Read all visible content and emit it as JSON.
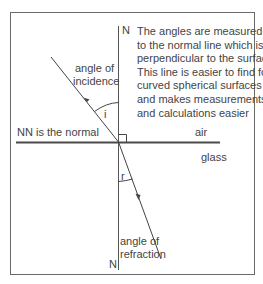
{
  "diagram": {
    "normal_top_label": "N",
    "normal_bottom_label": "N",
    "incidence_label_line1": "angle of",
    "incidence_label_line2": "incidence",
    "incidence_symbol": "i",
    "refraction_label_line1": "angle of",
    "refraction_label_line2": "refraction",
    "refraction_symbol": "r",
    "normal_note": "NN is the normal",
    "medium_top": "air",
    "medium_bottom": "glass",
    "note_lines": [
      "The angles are measured",
      "to the normal line which is",
      "perpendicular to the surface.",
      "This line is easier to find for",
      "curved spherical surfaces",
      "and makes measurements",
      "and calculations easier"
    ],
    "colors": {
      "line": "#3a3a3a",
      "surface": "#4a4a4a",
      "frame": "#6a6a6a",
      "text": "#444444"
    }
  }
}
